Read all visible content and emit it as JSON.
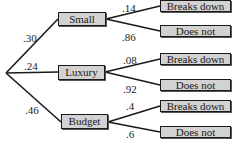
{
  "diagram": {
    "type": "probability-tree",
    "root": {
      "branches": [
        {
          "label": "Small",
          "probability": ".30",
          "children": [
            {
              "label": "Breaks down",
              "probability": ".14"
            },
            {
              "label": "Does not",
              "probability": ".86"
            }
          ]
        },
        {
          "label": "Luxury",
          "probability": ".24",
          "children": [
            {
              "label": "Breaks down",
              "probability": ".08"
            },
            {
              "label": "Does not",
              "probability": ".92"
            }
          ]
        },
        {
          "label": "Budget",
          "probability": ".46",
          "children": [
            {
              "label": "Breaks down",
              "probability": ".4"
            },
            {
              "label": "Does not",
              "probability": ".6"
            }
          ]
        }
      ]
    }
  },
  "colors": {
    "box_fill": "#d2d2d2",
    "line": "#1a1a1a"
  }
}
